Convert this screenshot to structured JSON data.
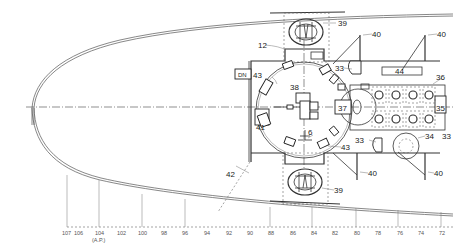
{
  "drawing": {
    "type": "ship deck plan (top view, bow section)",
    "callouts": {
      "c39_top": "39",
      "c12": "12",
      "c40_a": "40",
      "c40_b": "40",
      "c43_left": "43",
      "c33_top": "33",
      "c44": "44",
      "c36": "36",
      "c38": "38",
      "c37": "37",
      "c35": "35",
      "c41": "41",
      "c6": "6",
      "c43_bottom": "43",
      "c33_bottom": "33",
      "c34": "34",
      "c33_right": "33",
      "c42": "42",
      "c40_c": "40",
      "c40_d": "40",
      "c39_bottom": "39",
      "dn": "DN"
    },
    "frame_scale": {
      "ticks": [
        "107",
        "106",
        "104",
        "102",
        "100",
        "98",
        "96",
        "94",
        "92",
        "90",
        "88",
        "86",
        "84",
        "82",
        "80",
        "78",
        "76",
        "74",
        "72"
      ],
      "ap_note": "(A.P.)"
    }
  }
}
